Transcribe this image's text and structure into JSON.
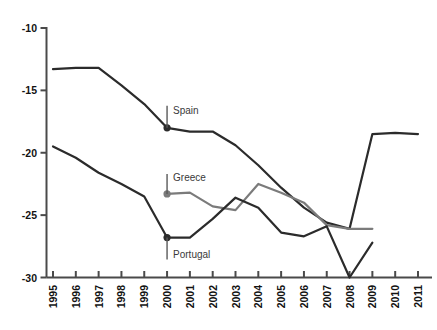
{
  "chart_data": {
    "type": "line",
    "title": "",
    "subtitle": "",
    "xlabel": "",
    "ylabel": "",
    "xlim": [
      1995,
      2011
    ],
    "ylim": [
      -30,
      -10
    ],
    "grid": false,
    "legend_position": "inline-annotations",
    "x": [
      1995,
      1996,
      1997,
      1998,
      1999,
      2000,
      2001,
      2002,
      2003,
      2004,
      2005,
      2006,
      2007,
      2008,
      2009,
      2010,
      2011
    ],
    "ytick_labels": [
      "-10",
      "-15",
      "-20",
      "-25",
      "-30"
    ],
    "ytick_values": [
      -10,
      -15,
      -20,
      -25,
      -30
    ],
    "xtick_labels": [
      "1995",
      "1996",
      "1997",
      "1998",
      "1999",
      "2000",
      "2001",
      "2002",
      "2003",
      "2004",
      "2005",
      "2006",
      "2007",
      "2008",
      "2009",
      "2010",
      "2011"
    ],
    "series": [
      {
        "name": "Spain",
        "color": "#2b2b2b",
        "x": [
          1995,
          1996,
          1997,
          1998,
          1999,
          2000,
          2001,
          2002,
          2003,
          2004,
          2005,
          2006,
          2007,
          2008,
          2009,
          2010,
          2011
        ],
        "values": [
          -13.3,
          -13.2,
          -13.2,
          -14.6,
          -16.1,
          -18.0,
          -18.3,
          -18.3,
          -19.4,
          -21.0,
          -22.8,
          -24.4,
          -25.6,
          -26.1,
          -18.5,
          -18.4,
          -18.5
        ],
        "marker_year": 2000,
        "marker_value": -18.0
      },
      {
        "name": "Greece",
        "color": "#7b7b7b",
        "x": [
          2000,
          2001,
          2002,
          2003,
          2004,
          2005,
          2006,
          2007,
          2008,
          2009
        ],
        "values": [
          -23.3,
          -23.2,
          -24.3,
          -24.6,
          -22.5,
          -23.2,
          -24.0,
          -25.8,
          -26.1,
          -26.1
        ],
        "marker_year": 2000,
        "marker_value": -23.3
      },
      {
        "name": "Portugal",
        "color": "#2b2b2b",
        "x": [
          1995,
          1996,
          1997,
          1998,
          1999,
          2000,
          2001,
          2002,
          2003,
          2004,
          2005,
          2006,
          2007,
          2008,
          2009
        ],
        "values": [
          -19.5,
          -20.4,
          -21.6,
          -22.5,
          -23.5,
          -26.8,
          -26.8,
          -25.3,
          -23.6,
          -24.4,
          -26.4,
          -26.7,
          -25.9,
          -30.0,
          -27.2
        ],
        "marker_year": 2000,
        "marker_value": -26.8
      }
    ],
    "annotations": [
      {
        "text": "Spain",
        "year": 2000,
        "value": -18.0
      },
      {
        "text": "Greece",
        "year": 2000,
        "value": -23.3
      },
      {
        "text": "Portugal",
        "year": 2000,
        "value": -26.8
      }
    ]
  }
}
